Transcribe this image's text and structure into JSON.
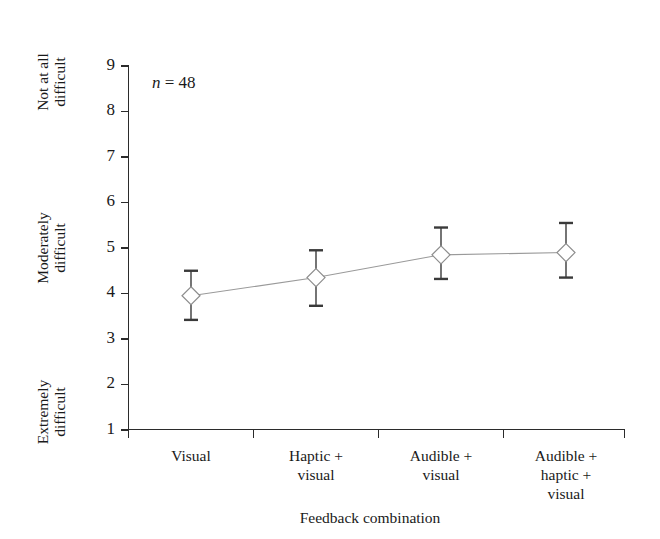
{
  "chart_data": {
    "type": "line",
    "title": "",
    "xlabel": "Feedback combination",
    "ylabel": "",
    "categories": [
      "Visual",
      "Haptic + visual",
      "Audible + visual",
      "Audible + haptic + visual"
    ],
    "category_lines": [
      [
        "Visual"
      ],
      [
        "Haptic +",
        "visual"
      ],
      [
        "Audible +",
        "visual"
      ],
      [
        "Audible +",
        "haptic +",
        "visual"
      ]
    ],
    "values": [
      3.95,
      4.35,
      4.85,
      4.9
    ],
    "error_low": [
      3.42,
      3.73,
      4.32,
      4.35
    ],
    "error_high": [
      4.5,
      4.95,
      5.45,
      5.55
    ],
    "ylim": [
      1,
      9
    ],
    "yticks": [
      1,
      2,
      3,
      4,
      5,
      6,
      7,
      8,
      9
    ],
    "ytick_labels": [
      "1",
      "2",
      "3",
      "4",
      "5",
      "6",
      "7",
      "8",
      "9"
    ],
    "y_category_labels": [
      {
        "value": 9,
        "lines": [
          "Not at all",
          "difficult"
        ]
      },
      {
        "value": 5,
        "lines": [
          "Moderately",
          "difficult"
        ]
      },
      {
        "value": 1,
        "lines": [
          "Extremely",
          "difficult"
        ]
      }
    ],
    "annotations": [
      {
        "name": "sample-size",
        "italic_part": "n",
        "rest": " = 48",
        "text": "n = 48"
      }
    ],
    "grid": false,
    "legend": "none",
    "marker": "diamond",
    "marker_fill": "#ffffff",
    "marker_stroke": "#8d8d8d",
    "line_color": "#9a9a9a",
    "error_color": "#3a3a3a",
    "axis_color": "#2b2b2b",
    "background": "#ffffff"
  },
  "annotation_text": {
    "n_italic": "n",
    "n_rest": " = 48"
  },
  "axis": {
    "x_title": "Feedback combination"
  },
  "y_axis_tick_text": {
    "t1": "1",
    "t2": "2",
    "t3": "3",
    "t4": "4",
    "t5": "5",
    "t6": "6",
    "t7": "7",
    "t8": "8",
    "t9": "9"
  },
  "y_category_text": {
    "top_line1": "Not at all",
    "top_line2": "difficult",
    "mid_line1": "Moderately",
    "mid_line2": "difficult",
    "bot_line1": "Extremely",
    "bot_line2": "difficult"
  },
  "x_category_text": {
    "c1_l1": "Visual",
    "c2_l1": "Haptic +",
    "c2_l2": "visual",
    "c3_l1": "Audible +",
    "c3_l2": "visual",
    "c4_l1": "Audible +",
    "c4_l2": "haptic +",
    "c4_l3": "visual"
  }
}
